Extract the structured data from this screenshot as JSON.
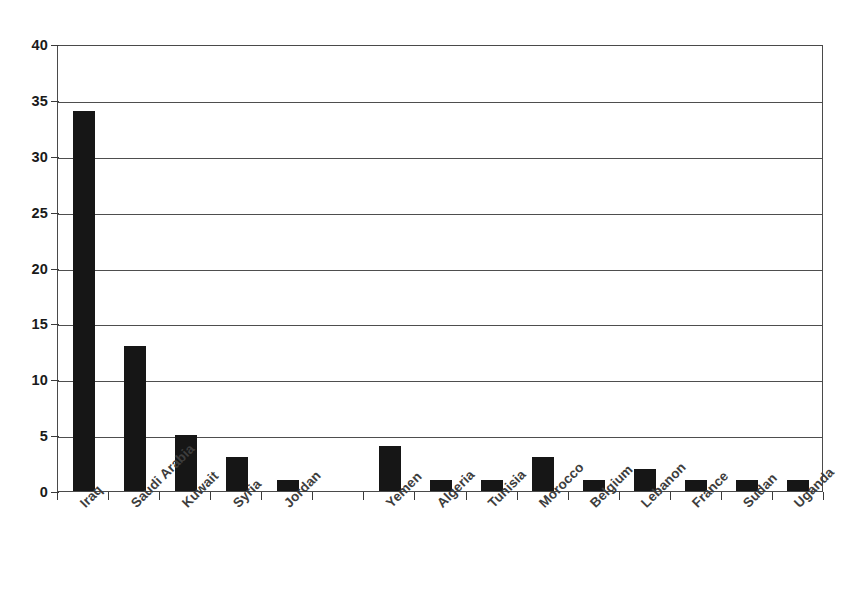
{
  "chart_data": {
    "type": "bar",
    "title": "",
    "subtitle": "",
    "xlabel": "",
    "ylabel": "",
    "categories": [
      "Iraq",
      "Saudi Arabia",
      "Kuwait",
      "Syria",
      "Jordan",
      "",
      "Yemen",
      "Algeria",
      "Tunisia",
      "Morocco",
      "Belgium",
      "Lebanon",
      "France",
      "Sudan",
      "Uganda"
    ],
    "values": [
      34,
      13,
      5,
      3,
      1,
      0,
      4,
      1,
      1,
      3,
      1,
      2,
      1,
      1,
      1
    ],
    "ylim": [
      0,
      40
    ],
    "y_ticks": [
      0,
      5,
      10,
      15,
      20,
      25,
      30,
      35,
      40
    ],
    "y_tick_labels": [
      "0",
      "5",
      "10",
      "15",
      "20",
      "25",
      "30",
      "35",
      "40"
    ],
    "grid": true,
    "grid_axis": "y",
    "legend": false,
    "legend_position": "none",
    "bar_color": "#161616",
    "grid_color": "#4e4e4e",
    "axis_color": "#4a4a4a",
    "label_color": "#3d3d3d",
    "background_color": "#ffffff",
    "x_tick_label_rotation": -45,
    "series": [
      {
        "name": "Count",
        "values": [
          34,
          13,
          5,
          3,
          1,
          0,
          4,
          1,
          1,
          3,
          1,
          2,
          1,
          1,
          1
        ]
      }
    ]
  }
}
